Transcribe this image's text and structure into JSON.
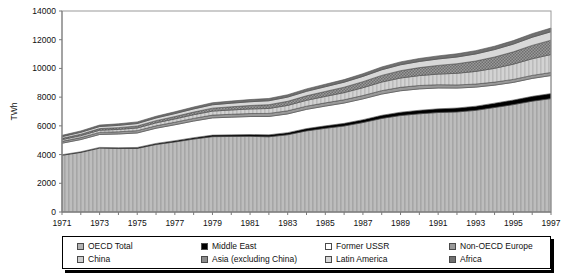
{
  "chart_data": {
    "type": "area",
    "stacked": true,
    "title": "",
    "xlabel": "",
    "ylabel": "TWh",
    "ylim": [
      0,
      14000
    ],
    "ytick_step": 2000,
    "yticks": [
      "0",
      "2000",
      "4000",
      "6000",
      "8000",
      "10000",
      "12000",
      "14000"
    ],
    "xlim": [
      1971,
      1997
    ],
    "xticks": [
      "1971",
      "1973",
      "1975",
      "1977",
      "1979",
      "1981",
      "1983",
      "1985",
      "1987",
      "1989",
      "1991",
      "1993",
      "1995",
      "1997"
    ],
    "x": [
      1971,
      1972,
      1973,
      1974,
      1975,
      1976,
      1977,
      1978,
      1979,
      1980,
      1981,
      1982,
      1983,
      1984,
      1985,
      1986,
      1987,
      1988,
      1989,
      1990,
      1991,
      1992,
      1993,
      1994,
      1995,
      1996,
      1997
    ],
    "grid": false,
    "legend_position": "bottom",
    "series": [
      {
        "name": "OECD Total",
        "color": "#b3b3b3",
        "pattern": "vertical-hatch",
        "values": [
          3950,
          4150,
          4450,
          4420,
          4430,
          4700,
          4880,
          5080,
          5250,
          5260,
          5270,
          5240,
          5380,
          5650,
          5830,
          5990,
          6230,
          6520,
          6720,
          6840,
          6930,
          6970,
          7080,
          7280,
          7480,
          7720,
          7900
        ]
      },
      {
        "name": "Middle East",
        "color": "#000000",
        "pattern": "solid",
        "values": [
          40,
          45,
          50,
          58,
          65,
          75,
          85,
          95,
          105,
          115,
          125,
          135,
          148,
          160,
          172,
          185,
          200,
          215,
          230,
          245,
          258,
          272,
          288,
          302,
          318,
          335,
          350
        ]
      },
      {
        "name": "Former USSR",
        "color": "#ffffff",
        "pattern": "solid",
        "values": [
          800,
          850,
          900,
          955,
          1010,
          1060,
          1110,
          1160,
          1200,
          1230,
          1255,
          1280,
          1305,
          1340,
          1375,
          1415,
          1450,
          1480,
          1495,
          1490,
          1450,
          1390,
          1330,
          1255,
          1230,
          1250,
          1255
        ]
      },
      {
        "name": "Non-OECD Europe",
        "color": "#9a9a9a",
        "pattern": "solid",
        "values": [
          130,
          138,
          146,
          154,
          162,
          170,
          178,
          186,
          194,
          202,
          208,
          212,
          216,
          220,
          224,
          228,
          232,
          236,
          238,
          236,
          228,
          220,
          214,
          210,
          208,
          210,
          212
        ]
      },
      {
        "name": "China",
        "color": "#cfcfcf",
        "pattern": "vertical-hatch",
        "values": [
          120,
          135,
          150,
          165,
          185,
          205,
          230,
          255,
          280,
          300,
          320,
          345,
          375,
          410,
          450,
          495,
          545,
          600,
          650,
          690,
          740,
          810,
          880,
          960,
          1060,
          1160,
          1250
        ]
      },
      {
        "name": "Asia (excluding China)",
        "color": "#8c8c8c",
        "pattern": "checker",
        "values": [
          90,
          100,
          112,
          124,
          138,
          152,
          168,
          185,
          205,
          222,
          240,
          262,
          288,
          315,
          345,
          380,
          420,
          465,
          510,
          555,
          605,
          665,
          725,
          790,
          860,
          930,
          1000
        ]
      },
      {
        "name": "Latin America",
        "color": "#d8d8d8",
        "pattern": "solid",
        "values": [
          120,
          132,
          145,
          158,
          172,
          186,
          202,
          218,
          235,
          250,
          262,
          275,
          292,
          310,
          328,
          348,
          368,
          390,
          410,
          428,
          448,
          470,
          492,
          516,
          540,
          566,
          590
        ]
      },
      {
        "name": "Africa",
        "color": "#707070",
        "pattern": "solid",
        "values": [
          90,
          96,
          102,
          108,
          114,
          120,
          127,
          134,
          141,
          148,
          153,
          158,
          164,
          170,
          176,
          182,
          189,
          196,
          203,
          209,
          215,
          222,
          229,
          236,
          243,
          250,
          257
        ]
      }
    ]
  },
  "legend": {
    "rows": [
      [
        {
          "label": "OECD Total",
          "swatch": "#b3b3b3"
        },
        {
          "label": "Middle East",
          "swatch": "#000000"
        },
        {
          "label": "Former USSR",
          "swatch": "#ffffff"
        },
        {
          "label": "Non-OECD Europe",
          "swatch": "#9a9a9a"
        }
      ],
      [
        {
          "label": "China",
          "swatch": "#cfcfcf"
        },
        {
          "label": "Asia (excluding China)",
          "swatch": "#8c8c8c"
        },
        {
          "label": "Latin America",
          "swatch": "#d8d8d8"
        },
        {
          "label": "Africa",
          "swatch": "#707070"
        }
      ]
    ]
  }
}
